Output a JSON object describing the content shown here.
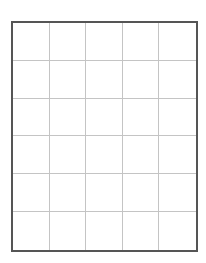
{
  "grid": {
    "rows": 6,
    "columns": 5,
    "cells": [
      [
        "",
        "",
        "",
        "",
        ""
      ],
      [
        "",
        "",
        "",
        "",
        ""
      ],
      [
        "",
        "",
        "",
        "",
        ""
      ],
      [
        "",
        "",
        "",
        "",
        ""
      ],
      [
        "",
        "",
        "",
        "",
        ""
      ],
      [
        "",
        "",
        "",
        "",
        ""
      ]
    ],
    "colors": {
      "background": "#ffffff",
      "border": "#555555",
      "gridline": "#c4c4c4"
    }
  }
}
